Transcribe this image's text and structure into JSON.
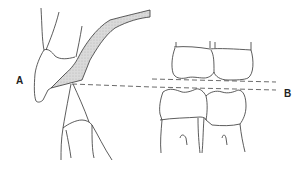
{
  "diagram": {
    "type": "dental-occlusion-illustration",
    "labels": {
      "a": "A",
      "b": "B"
    },
    "panels": [
      {
        "id": "A",
        "description": "Lateral view of incisors with shaded occlusal plane band and dashed reference line"
      },
      {
        "id": "B",
        "description": "Upper and lower posterior teeth with two dashed occlusal reference lines"
      }
    ],
    "colors": {
      "line": "#333333",
      "shading": "#d8d8d8",
      "dash": "#444444",
      "background": "#ffffff"
    }
  }
}
